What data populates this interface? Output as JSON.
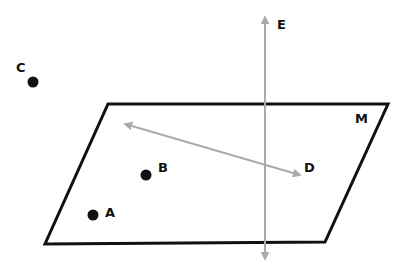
{
  "diagram": {
    "plane": {
      "label": "M",
      "points": [
        [
          108,
          104
        ],
        [
          388,
          104
        ],
        [
          325,
          242
        ],
        [
          45,
          244
        ]
      ],
      "stroke": "#111111"
    },
    "line_vertical": {
      "label": "E",
      "x": 265,
      "y1": 17,
      "y2": 259,
      "color": "#aaaaaa"
    },
    "line_in_plane": {
      "label": "D",
      "x1": 125,
      "y1": 124,
      "x2": 300,
      "y2": 175,
      "color": "#aaaaaa"
    },
    "points": [
      {
        "label": "C",
        "x": 33,
        "y": 82
      },
      {
        "label": "B",
        "x": 146,
        "y": 175
      },
      {
        "label": "A",
        "x": 93,
        "y": 215
      }
    ]
  },
  "labels": {
    "C": "C",
    "E": "E",
    "M": "M",
    "D": "D",
    "B": "B",
    "A": "A"
  }
}
